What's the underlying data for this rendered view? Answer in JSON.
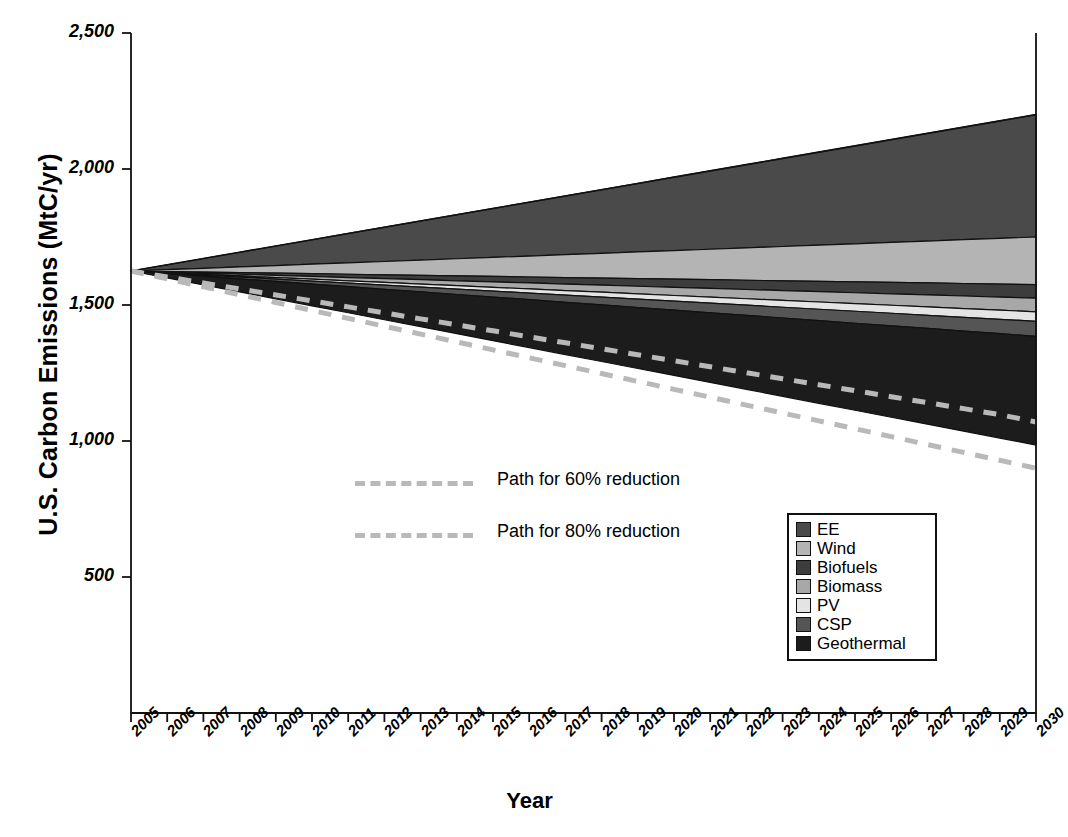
{
  "chart_data": {
    "type": "area",
    "title": "",
    "xlabel": "Year",
    "ylabel": "U.S. Carbon Emissions (MtC/yr)",
    "xlim": [
      2005,
      2030
    ],
    "ylim": [
      0,
      2500
    ],
    "grid": false,
    "legend_position": "inside-bottom-right",
    "stacking": "wedges-below-business-as-usual",
    "x": [
      2005,
      2006,
      2007,
      2008,
      2009,
      2010,
      2011,
      2012,
      2013,
      2014,
      2015,
      2016,
      2017,
      2018,
      2019,
      2020,
      2021,
      2022,
      2023,
      2024,
      2025,
      2026,
      2027,
      2028,
      2029,
      2030
    ],
    "yticks": [
      500,
      1000,
      1500,
      2000,
      2500
    ],
    "ytick_labels": [
      "500",
      "1,000",
      "1,500",
      "2,000",
      "2,500"
    ],
    "xtick_labels": [
      "2005",
      "2006",
      "2007",
      "2008",
      "2009",
      "2010",
      "2011",
      "2012",
      "2013",
      "2014",
      "2015",
      "2016",
      "2017",
      "2018",
      "2019",
      "2020",
      "2021",
      "2022",
      "2023",
      "2024",
      "2025",
      "2026",
      "2027",
      "2028",
      "2029",
      "2030"
    ],
    "baseline_name": "Business as usual",
    "baseline_values": [
      1625,
      1648,
      1671,
      1694,
      1717,
      1740,
      1763,
      1786,
      1809,
      1832,
      1855,
      1878,
      1901,
      1924,
      1947,
      1970,
      1993,
      2016,
      2039,
      2062,
      2085,
      2108,
      2131,
      2154,
      2177,
      2200
    ],
    "remaining_emissions_2030": 985,
    "series": [
      {
        "name": "EE",
        "color": "#4a4a4a",
        "values": [
          0,
          18,
          36,
          54,
          72,
          90,
          108,
          126,
          144,
          162,
          180,
          198,
          216,
          234,
          252,
          270,
          288,
          306,
          324,
          342,
          360,
          378,
          396,
          414,
          432,
          450
        ]
      },
      {
        "name": "Wind",
        "color": "#b4b4b4",
        "values": [
          0,
          7,
          14,
          21,
          28,
          35,
          42,
          49,
          56,
          63,
          70,
          77,
          84,
          91,
          98,
          105,
          112,
          119,
          126,
          133,
          140,
          147,
          154,
          161,
          168,
          175
        ]
      },
      {
        "name": "Biofuels",
        "color": "#3d3d3d",
        "values": [
          0,
          2,
          4,
          6,
          8,
          10,
          12,
          14,
          16,
          18,
          20,
          22,
          24,
          26,
          28,
          30,
          32,
          34,
          36,
          38,
          40,
          42,
          44,
          46,
          48,
          50
        ]
      },
      {
        "name": "Biomass",
        "color": "#a8a8a8",
        "values": [
          0,
          2,
          4,
          6,
          8,
          10,
          12,
          14,
          16,
          18,
          20,
          22,
          24,
          26,
          28,
          30,
          32,
          34,
          36,
          38,
          40,
          42,
          44,
          46,
          48,
          50
        ]
      },
      {
        "name": "PV",
        "color": "#e4e4e4",
        "values": [
          0,
          1.4,
          2.8,
          4.2,
          5.6,
          7,
          8.4,
          9.8,
          11.2,
          12.6,
          14,
          15.4,
          16.8,
          18.2,
          19.6,
          21,
          22.4,
          23.8,
          25.2,
          26.6,
          28,
          29.4,
          30.8,
          32.2,
          33.6,
          35
        ]
      },
      {
        "name": "CSP",
        "color": "#555555",
        "values": [
          0,
          2.2,
          4.4,
          6.6,
          8.8,
          11,
          13.2,
          15.4,
          17.6,
          19.8,
          22,
          24.2,
          26.4,
          28.6,
          30.8,
          33,
          35.2,
          37.4,
          39.6,
          41.8,
          44,
          46.2,
          48.4,
          50.6,
          52.8,
          55
        ]
      },
      {
        "name": "Geothermal",
        "color": "#1c1c1c",
        "values": [
          0,
          16,
          32,
          48,
          64,
          80,
          96,
          112,
          128,
          144,
          160,
          176,
          192,
          208,
          224,
          240,
          256,
          272,
          288,
          304,
          320,
          336,
          352,
          368,
          384,
          400
        ]
      }
    ],
    "reference_paths": [
      {
        "name": "Path for 60% reduction",
        "style": "dashed",
        "color": "#b9b9b9",
        "values": [
          1625,
          1603,
          1581,
          1559,
          1537,
          1515,
          1493,
          1471,
          1449,
          1427,
          1405,
          1383,
          1361,
          1339,
          1317,
          1295,
          1273,
          1251,
          1229,
          1207,
          1185,
          1163,
          1141,
          1119,
          1097,
          1070
        ]
      },
      {
        "name": "Path for 80% reduction",
        "style": "dashed",
        "color": "#b9b9b9",
        "values": [
          1625,
          1596,
          1567,
          1538,
          1509,
          1480,
          1451,
          1422,
          1393,
          1364,
          1335,
          1306,
          1277,
          1248,
          1219,
          1190,
          1161,
          1132,
          1103,
          1074,
          1045,
          1016,
          987,
          958,
          929,
          900
        ]
      }
    ]
  },
  "axes": {
    "y_title": "U.S. Carbon Emissions (MtC/yr)",
    "x_title": "Year"
  },
  "legend": {
    "items": [
      {
        "label": "EE"
      },
      {
        "label": "Wind"
      },
      {
        "label": "Biofuels"
      },
      {
        "label": "Biomass"
      },
      {
        "label": "PV"
      },
      {
        "label": "CSP"
      },
      {
        "label": "Geothermal"
      }
    ]
  },
  "annotations": {
    "path60_label": "Path for 60% reduction",
    "path80_label": "Path for 80% reduction"
  }
}
